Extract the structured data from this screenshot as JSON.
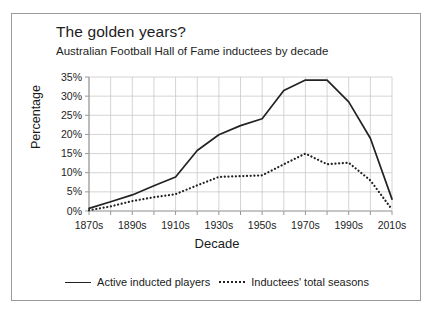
{
  "chart_data": {
    "type": "line",
    "title": "The golden years?",
    "subtitle": "Australian Football Hall of Fame inductees by decade",
    "xlabel": "Decade",
    "ylabel": "Percentage",
    "grid": true,
    "legend_position": "bottom",
    "ylim": [
      0,
      35
    ],
    "ytick_labels": [
      "35%",
      "30%",
      "25%",
      "20%",
      "15%",
      "10%",
      "5%",
      "0%"
    ],
    "ytick_values": [
      35,
      30,
      25,
      20,
      15,
      10,
      5,
      0
    ],
    "categories": [
      "1870s",
      "1880s",
      "1890s",
      "1900s",
      "1910s",
      "1920s",
      "1930s",
      "1940s",
      "1950s",
      "1960s",
      "1970s",
      "1980s",
      "1990s",
      "2000s",
      "2010s"
    ],
    "xtick_labels": [
      "1870s",
      "1890s",
      "1910s",
      "1930s",
      "1950s",
      "1970s",
      "1990s",
      "2010s"
    ],
    "series": [
      {
        "name": "Active inducted players",
        "style": "solid",
        "color": "#222222",
        "values": [
          0.7,
          2.4,
          4.2,
          6.6,
          8.9,
          15.8,
          19.9,
          22.3,
          24.1,
          31.5,
          34.2,
          34.2,
          28.5,
          19.0,
          3.1
        ]
      },
      {
        "name": "Inductees' total seasons",
        "style": "dotted",
        "color": "#222222",
        "values": [
          0.2,
          1.2,
          2.6,
          3.6,
          4.4,
          6.7,
          8.9,
          9.1,
          9.3,
          12.2,
          15.0,
          12.2,
          12.6,
          8.0,
          0.4
        ]
      }
    ]
  },
  "legend": {
    "items": [
      {
        "label": "Active inducted players"
      },
      {
        "label": "Inductees' total seasons"
      }
    ]
  }
}
